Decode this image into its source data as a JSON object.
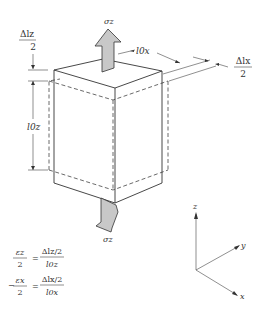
{
  "figure": {
    "colors": {
      "line": "#333333",
      "arrow_fill": "#c8c8c8",
      "background": "#ffffff"
    },
    "stress_top_label": "σz",
    "stress_bottom_label": "σz",
    "dim_delta_lz": {
      "numerator": "Δlz",
      "denominator": "2"
    },
    "dim_l0z": "l0z",
    "dim_l0x": "l0x",
    "dim_delta_lx": {
      "numerator": "Δlx",
      "denominator": "2"
    },
    "axes": {
      "z": "z",
      "y": "y",
      "x": "x"
    },
    "equations": [
      {
        "lhs_num": "εz",
        "lhs_den": "2",
        "prefix": "",
        "rhs_num": "Δlz/2",
        "rhs_den": "l0z"
      },
      {
        "lhs_num": "εx",
        "lhs_den": "2",
        "prefix": "−",
        "rhs_num": "Δlx/2",
        "rhs_den": "l0x"
      }
    ]
  }
}
